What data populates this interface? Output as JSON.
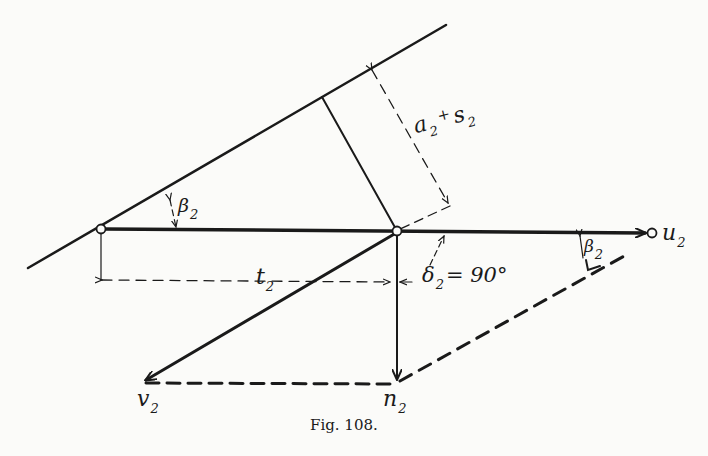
{
  "figure": {
    "caption": "Fig. 108.",
    "labels": {
      "a2s2": {
        "main": "a",
        "sub": "2",
        "plus": "+",
        "main2": "s",
        "sub2": "2"
      },
      "beta_left": {
        "main": "β",
        "sub": "2"
      },
      "beta_right": {
        "main": "β",
        "sub": "2"
      },
      "u2": {
        "main": "u",
        "sub": "2"
      },
      "v2": {
        "main": "v",
        "sub": "2"
      },
      "n2": {
        "main": "n",
        "sub": "2"
      },
      "t2": {
        "main": "t",
        "sub": "2"
      },
      "delta2": {
        "main": "δ",
        "sub": "2",
        "value": "= 90°"
      }
    },
    "colors": {
      "ink": "#1a1a1a",
      "paper": "#fbfbf9"
    }
  }
}
